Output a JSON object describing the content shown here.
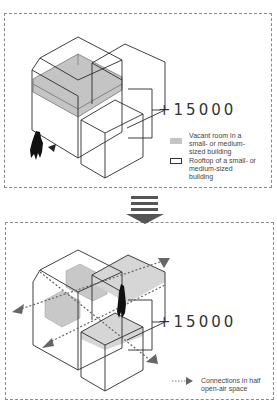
{
  "top_panel": {
    "elevation_label": "+15000",
    "legend": [
      {
        "swatch": "gray-fill",
        "label": "Vacant room in a small- or medium-sized building"
      },
      {
        "swatch": "outline",
        "label": "Rooftop of a small- or medium-sized building"
      }
    ]
  },
  "transition_arrow": {
    "direction": "down",
    "icon": "down-arrow-icon"
  },
  "bottom_panel": {
    "elevation_label": "+15000",
    "legend": [
      {
        "swatch": "dotted-arrow",
        "label": "Connections in half open-air space"
      }
    ]
  },
  "colors": {
    "line": "#2a2a2a",
    "vacant_fill": "#c4c4c4",
    "rooftop_fill": "#d6d6d6",
    "connection": "#666666",
    "figure": "#111111",
    "border": "#8a8a8a"
  }
}
